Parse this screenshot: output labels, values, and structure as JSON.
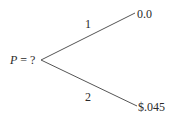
{
  "tree": {
    "root": {
      "variable": "P",
      "equals": " = ?"
    },
    "branches": [
      {
        "label": "1",
        "outcome": "0.0"
      },
      {
        "label": "2",
        "outcome": "$.045"
      }
    ]
  }
}
